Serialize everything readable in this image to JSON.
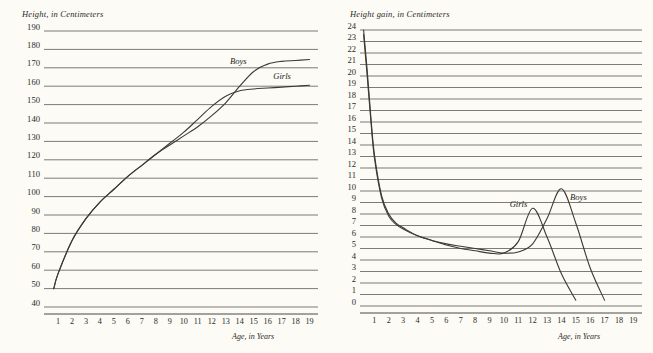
{
  "page": {
    "background_color": "#fcfbf6",
    "ink_color": "#3b3a36"
  },
  "charts": [
    {
      "id": "height-chart",
      "ylabel": "Height, in Centimeters",
      "xlabel": "Age, in Years"
    },
    {
      "id": "height-gain-chart",
      "ylabel": "Height gain, in Centimeters",
      "xlabel": "Age, in Years"
    }
  ],
  "chart_data": [
    {
      "type": "line",
      "title": "",
      "ylabel": "Height, in Centimeters",
      "xlabel": "Age, in Years",
      "xlim": [
        0,
        19.6
      ],
      "ylim": [
        40,
        190
      ],
      "yticks": [
        190,
        180,
        170,
        160,
        150,
        140,
        130,
        120,
        110,
        100,
        90,
        80,
        70,
        60,
        50,
        40
      ],
      "xticks": [
        1,
        2,
        3,
        4,
        5,
        6,
        7,
        8,
        9,
        10,
        11,
        12,
        13,
        14,
        15,
        16,
        17,
        18,
        19
      ],
      "grid": true,
      "legend_position": "inline-annotation",
      "x": [
        0.7,
        1,
        2,
        3,
        4,
        5,
        6,
        7,
        8,
        9,
        10,
        11,
        12,
        13,
        14,
        15,
        16,
        17,
        18,
        19
      ],
      "series": [
        {
          "name": "Boys",
          "label_x": 13.3,
          "label_y": 172,
          "values": [
            50,
            58,
            76,
            88,
            97,
            104,
            111,
            117,
            123,
            128,
            133,
            138,
            144,
            151,
            160,
            168,
            172,
            173.5,
            174,
            174.5
          ]
        },
        {
          "name": "Girls",
          "label_x": 16.4,
          "label_y": 164,
          "values": [
            50,
            58,
            76,
            88,
            97,
            104,
            111,
            117,
            123,
            129,
            135,
            142,
            149,
            154.5,
            157.5,
            158.5,
            159,
            159.5,
            160,
            160.5
          ]
        }
      ]
    },
    {
      "type": "line",
      "title": "",
      "ylabel": "Height gain, in Centimeters",
      "xlabel": "Age, in Years",
      "xlim": [
        0,
        19.6
      ],
      "ylim": [
        0,
        24
      ],
      "yticks": [
        24,
        23,
        22,
        21,
        20,
        19,
        18,
        17,
        16,
        15,
        14,
        13,
        12,
        11,
        10,
        9,
        8,
        7,
        6,
        5,
        4,
        3,
        2,
        1,
        0
      ],
      "xticks": [
        1,
        2,
        3,
        4,
        5,
        6,
        7,
        8,
        9,
        10,
        11,
        12,
        13,
        14,
        15,
        16,
        17,
        18,
        19
      ],
      "grid": true,
      "legend_position": "inline-annotation",
      "x": [
        0.25,
        0.5,
        0.75,
        1,
        1.5,
        2,
        2.5,
        3,
        4,
        5,
        6,
        7,
        8,
        9,
        10,
        11,
        12,
        13,
        14,
        15,
        16,
        17,
        18
      ],
      "series": [
        {
          "name": "Girls",
          "label_x": 10.4,
          "label_y": 8.6,
          "values": [
            24,
            20.5,
            16.5,
            13.2,
            9.6,
            8.0,
            7.2,
            6.8,
            6.1,
            5.7,
            5.3,
            5.0,
            4.8,
            4.6,
            4.6,
            5.6,
            8.5,
            6.0,
            2.8,
            0.5,
            null,
            null,
            null
          ]
        },
        {
          "name": "Boys",
          "label_x": 14.6,
          "label_y": 9.2,
          "values": [
            23.6,
            20.0,
            16.2,
            12.9,
            9.4,
            7.8,
            7.1,
            6.7,
            6.1,
            5.7,
            5.4,
            5.2,
            5.0,
            4.8,
            4.6,
            4.7,
            5.4,
            7.6,
            10.2,
            7.2,
            3.3,
            0.5,
            null
          ]
        }
      ]
    }
  ]
}
